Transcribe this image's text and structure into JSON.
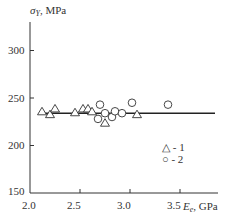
{
  "chart_data": {
    "type": "scatter",
    "title": "",
    "xlabel": "E_e, GPa",
    "ylabel": "σ_Y, MPa",
    "xlim": [
      2.0,
      4.0
    ],
    "ylim": [
      150,
      330
    ],
    "x_ticks": [
      2.0,
      2.5,
      3.0,
      3.5
    ],
    "y_ticks": [
      150,
      200,
      250,
      300
    ],
    "grid": false,
    "legend_position": "lower right inside",
    "series": [
      {
        "name": "1",
        "marker": "triangle",
        "x": [
          2.12,
          2.2,
          2.25,
          2.45,
          2.53,
          2.58,
          2.62,
          2.75,
          3.07
        ],
        "y": [
          236,
          233,
          239,
          235,
          239,
          239,
          236,
          224,
          233
        ]
      },
      {
        "name": "2",
        "marker": "circle",
        "x": [
          2.7,
          2.68,
          2.75,
          2.82,
          2.85,
          2.92,
          3.02,
          3.38
        ],
        "y": [
          243,
          228,
          234,
          230,
          236,
          234,
          245,
          243
        ]
      }
    ],
    "trend_line": {
      "x": [
        2.1,
        3.85
      ],
      "y": [
        234,
        234
      ]
    }
  },
  "labels": {
    "y_main": "σ",
    "y_sub": "Y",
    "y_unit": ", MPa",
    "x_main": "E",
    "x_sub": "e",
    "x_unit": ", GPa",
    "ticks_x": [
      "2.0",
      "2.5",
      "3.0",
      "3.5"
    ],
    "ticks_y": [
      "300",
      "250",
      "200",
      "150"
    ],
    "legend": [
      {
        "symbol": "△",
        "text": " - 1"
      },
      {
        "symbol": "○",
        "text": " - 2"
      }
    ]
  }
}
